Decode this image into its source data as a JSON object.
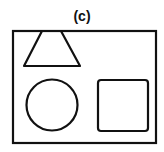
{
  "figure": {
    "label": "(c)",
    "stroke_color": "#111111",
    "background_color": "#ffffff",
    "shapes": [
      {
        "name": "frame",
        "type": "rectangle"
      },
      {
        "name": "trapezoid",
        "type": "trapezoid"
      },
      {
        "name": "circle",
        "type": "circle"
      },
      {
        "name": "square",
        "type": "rounded-square"
      }
    ]
  }
}
